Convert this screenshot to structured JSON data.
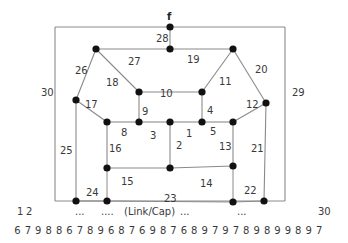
{
  "diagram": {
    "source_label": "f",
    "frame": {
      "x1": 55,
      "y1": 27,
      "x2": 285,
      "y2": 201
    },
    "nodes": [
      {
        "id": "f",
        "x": 170,
        "y": 27
      },
      {
        "id": "n_top_mid",
        "x": 170,
        "y": 49
      },
      {
        "id": "n_top_left",
        "x": 96,
        "y": 49
      },
      {
        "id": "n_top_right",
        "x": 233,
        "y": 49
      },
      {
        "id": "n_mid_left",
        "x": 76,
        "y": 100
      },
      {
        "id": "n_mid_right",
        "x": 266,
        "y": 103
      },
      {
        "id": "n_in_tl",
        "x": 139,
        "y": 92
      },
      {
        "id": "n_in_tr",
        "x": 202,
        "y": 92
      },
      {
        "id": "n_r1",
        "x": 107,
        "y": 122
      },
      {
        "id": "n_r2",
        "x": 139,
        "y": 122
      },
      {
        "id": "n_r3",
        "x": 170,
        "y": 122
      },
      {
        "id": "n_r4",
        "x": 202,
        "y": 122
      },
      {
        "id": "n_r5",
        "x": 233,
        "y": 122
      },
      {
        "id": "n_l1",
        "x": 107,
        "y": 168
      },
      {
        "id": "n_l2",
        "x": 170,
        "y": 168
      },
      {
        "id": "n_l3",
        "x": 233,
        "y": 166
      },
      {
        "id": "n_b1",
        "x": 76,
        "y": 201
      },
      {
        "id": "n_b2",
        "x": 107,
        "y": 201
      },
      {
        "id": "n_b3",
        "x": 233,
        "y": 202
      },
      {
        "id": "n_b4",
        "x": 264,
        "y": 201
      }
    ],
    "edges": [
      {
        "label": "1",
        "x1": 170,
        "y1": 122,
        "x2": 202,
        "y2": 122,
        "lx": 186,
        "ly": 133
      },
      {
        "label": "2",
        "x1": 170,
        "y1": 122,
        "x2": 170,
        "y2": 168,
        "lx": 176,
        "ly": 145
      },
      {
        "label": "3",
        "x1": 139,
        "y1": 122,
        "x2": 170,
        "y2": 122,
        "lx": 150,
        "ly": 135
      },
      {
        "label": "4",
        "x1": 202,
        "y1": 92,
        "x2": 202,
        "y2": 122,
        "lx": 207,
        "ly": 110
      },
      {
        "label": "5",
        "x1": 202,
        "y1": 122,
        "x2": 233,
        "y2": 122,
        "lx": 210,
        "ly": 131
      },
      {
        "label": "8",
        "x1": 107,
        "y1": 122,
        "x2": 139,
        "y2": 122,
        "lx": 121,
        "ly": 132
      },
      {
        "label": "9",
        "x1": 139,
        "y1": 92,
        "x2": 139,
        "y2": 122,
        "lx": 142,
        "ly": 111
      },
      {
        "label": "10",
        "x1": 139,
        "y1": 92,
        "x2": 202,
        "y2": 92,
        "lx": 160,
        "ly": 93
      },
      {
        "label": "11",
        "x1": 202,
        "y1": 92,
        "x2": 233,
        "y2": 49,
        "lx": 219,
        "ly": 81
      },
      {
        "label": "12",
        "x1": 233,
        "y1": 122,
        "x2": 266,
        "y2": 103,
        "lx": 246,
        "ly": 104
      },
      {
        "label": "13",
        "x1": 233,
        "y1": 122,
        "x2": 233,
        "y2": 166,
        "lx": 219,
        "ly": 146
      },
      {
        "label": "14",
        "x1": 170,
        "y1": 168,
        "x2": 233,
        "y2": 166,
        "lx": 200,
        "ly": 183
      },
      {
        "label": "15",
        "x1": 107,
        "y1": 168,
        "x2": 170,
        "y2": 168,
        "lx": 121,
        "ly": 181
      },
      {
        "label": "16",
        "x1": 107,
        "y1": 122,
        "x2": 107,
        "y2": 168,
        "lx": 109,
        "ly": 148
      },
      {
        "label": "17",
        "x1": 76,
        "y1": 100,
        "x2": 107,
        "y2": 122,
        "lx": 85,
        "ly": 104
      },
      {
        "label": "18",
        "x1": 96,
        "y1": 49,
        "x2": 139,
        "y2": 92,
        "lx": 106,
        "ly": 82
      },
      {
        "label": "19",
        "x1": 170,
        "y1": 49,
        "x2": 233,
        "y2": 49,
        "lx": 187,
        "ly": 59
      },
      {
        "label": "20",
        "x1": 233,
        "y1": 49,
        "x2": 266,
        "y2": 103,
        "lx": 255,
        "ly": 69
      },
      {
        "label": "21",
        "x1": 266,
        "y1": 103,
        "x2": 264,
        "y2": 201,
        "lx": 251,
        "ly": 148
      },
      {
        "label": "22",
        "x1": 233,
        "y1": 202,
        "x2": 264,
        "y2": 201,
        "lx": 244,
        "ly": 190
      },
      {
        "label": "23",
        "x1": 107,
        "y1": 201,
        "x2": 233,
        "y2": 202,
        "lx": 164,
        "ly": 198
      },
      {
        "label": "24",
        "x1": 76,
        "y1": 201,
        "x2": 107,
        "y2": 201,
        "lx": 86,
        "ly": 192
      },
      {
        "label": "25",
        "x1": 76,
        "y1": 100,
        "x2": 76,
        "y2": 201,
        "lx": 60,
        "ly": 150
      },
      {
        "label": "26",
        "x1": 96,
        "y1": 49,
        "x2": 76,
        "y2": 100,
        "lx": 75,
        "ly": 70
      },
      {
        "label": "27",
        "x1": 96,
        "y1": 49,
        "x2": 170,
        "y2": 49,
        "lx": 128,
        "ly": 61
      },
      {
        "label": "28",
        "x1": 170,
        "y1": 27,
        "x2": 170,
        "y2": 49,
        "lx": 156,
        "ly": 38
      },
      {
        "label": "29",
        "x1": 285,
        "y1": 27,
        "x2": 285,
        "y2": 201,
        "lx": 292,
        "ly": 92
      },
      {
        "label": "30",
        "x1": 55,
        "y1": 27,
        "x2": 55,
        "y2": 201,
        "lx": 41,
        "ly": 92
      }
    ],
    "extra_edges": [
      {
        "x1": 107,
        "y1": 168,
        "x2": 107,
        "y2": 201
      },
      {
        "x1": 233,
        "y1": 166,
        "x2": 233,
        "y2": 202
      },
      {
        "x1": 55,
        "y1": 27,
        "x2": 285,
        "y2": 27
      },
      {
        "x1": 55,
        "y1": 201,
        "x2": 285,
        "y2": 201
      }
    ]
  },
  "legend": {
    "index_row": [
      {
        "text": "1",
        "x": 17
      },
      {
        "text": "2",
        "x": 26
      },
      {
        "text": "...",
        "x": 75
      },
      {
        "text": "....",
        "x": 101
      },
      {
        "text": "(Link/Cap)",
        "x": 124
      },
      {
        "text": "...",
        "x": 180
      },
      {
        "text": "...",
        "x": 237
      },
      {
        "text": "30",
        "x": 318
      }
    ],
    "capacities": [
      6,
      7,
      9,
      8,
      8,
      6,
      7,
      8,
      9,
      6,
      8,
      7,
      6,
      9,
      8,
      7,
      6,
      8,
      9,
      7,
      9,
      7,
      8,
      9,
      8,
      9,
      9,
      8,
      9,
      7
    ]
  }
}
